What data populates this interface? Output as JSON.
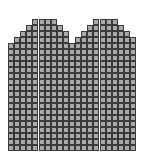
{
  "figure": {
    "cell_color": "#a9a9a9",
    "line_color": "#3a3a3a",
    "background": "#ffffff",
    "columns": 21,
    "rows": 22,
    "row_spans": [
      [
        [
          4,
          7
        ],
        [
          14,
          17
        ]
      ],
      [
        [
          3,
          8
        ],
        [
          13,
          18
        ]
      ],
      [
        [
          2,
          9
        ],
        [
          12,
          19
        ]
      ],
      [
        [
          1,
          9
        ],
        [
          11,
          20
        ]
      ],
      [
        [
          0,
          20
        ]
      ],
      [
        [
          0,
          20
        ]
      ],
      [
        [
          0,
          20
        ]
      ],
      [
        [
          0,
          20
        ]
      ],
      [
        [
          0,
          20
        ]
      ],
      [
        [
          0,
          20
        ]
      ],
      [
        [
          0,
          20
        ]
      ],
      [
        [
          0,
          20
        ]
      ],
      [
        [
          0,
          20
        ]
      ],
      [
        [
          0,
          20
        ]
      ],
      [
        [
          0,
          20
        ]
      ],
      [
        [
          0,
          20
        ]
      ],
      [
        [
          0,
          20
        ]
      ],
      [
        [
          0,
          20
        ]
      ],
      [
        [
          0,
          20
        ]
      ],
      [
        [
          0,
          20
        ]
      ],
      [
        [
          0,
          20
        ]
      ],
      [
        [
          0,
          20
        ]
      ]
    ]
  }
}
